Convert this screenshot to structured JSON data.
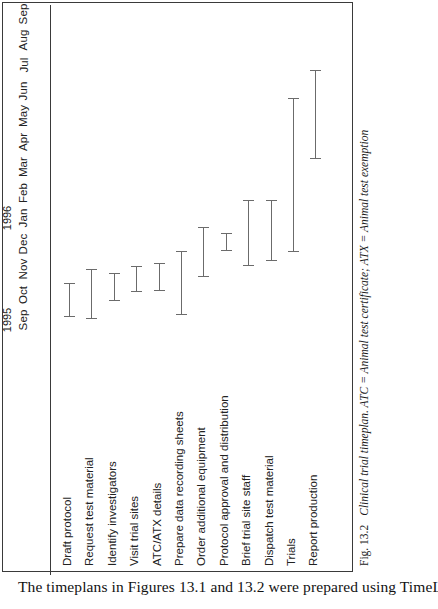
{
  "page": {
    "body_text": "The timeplans in Figures 13.1 and 13.2 were prepared using TimeLine"
  },
  "figure": {
    "number": "Fig. 13.2",
    "caption": "Clinical trial timeplan. ATC = Animal test certificate; ATX = Animal test exemption",
    "frame_color": "#3a3a3a",
    "bar_color": "#6b6b6b"
  },
  "chart_data": {
    "type": "bar",
    "title": "Clinical trial timeplan",
    "orientation": "gantt-rotated",
    "xlabel": "",
    "ylabel": "",
    "grid": false,
    "legend": "none",
    "years": [
      {
        "label": "1995",
        "months": [
          "Sep",
          "Oct",
          "Nov",
          "Dec"
        ]
      },
      {
        "label": "1996",
        "months": [
          "Jan",
          "Feb",
          "Mar",
          "Apr",
          "May",
          "Jun",
          "Jul",
          "Aug",
          "Sep"
        ]
      }
    ],
    "axis_ticks": [
      "Sep",
      "Oct",
      "Nov",
      "Dec",
      "Jan",
      "Feb",
      "Mar",
      "Apr",
      "May",
      "Jun",
      "Jul",
      "Aug",
      "Sep"
    ],
    "axis_range": [
      "1995-09",
      "1996-09"
    ],
    "categories": [
      "Draft protocol",
      "Request test material",
      "Identify investigators",
      "Visit trial sites",
      "ATC/ATX details",
      "Prepare data recording sheets",
      "Order additional equipment",
      "Protocol approval and distribution",
      "Brief trial site staff",
      "Dispatch test material",
      "Trials",
      "Report production"
    ],
    "tasks": [
      {
        "name": "Draft protocol",
        "start": "Sep 1995",
        "end": "Oct 1995",
        "start_index": 0.1,
        "end_index": 1.45
      },
      {
        "name": "Request test material",
        "start": "Sep 1995",
        "end": "Nov 1995",
        "start_index": 0.05,
        "end_index": 2.0
      },
      {
        "name": "Identify investigators",
        "start": "Oct 1995",
        "end": "Nov 1995",
        "start_index": 0.75,
        "end_index": 1.85
      },
      {
        "name": "Visit trial sites",
        "start": "Oct 1995",
        "end": "Nov 1995",
        "start_index": 1.1,
        "end_index": 2.1
      },
      {
        "name": "ATC/ATX details",
        "start": "Oct 1995",
        "end": "Dec 1995",
        "start_index": 1.15,
        "end_index": 2.25
      },
      {
        "name": "Prepare data recording sheets",
        "start": "Sep 1995",
        "end": "Dec 1995",
        "start_index": 0.2,
        "end_index": 2.7
      },
      {
        "name": "Order additional equipment",
        "start": "Nov 1995",
        "end": "Jan 1996",
        "start_index": 1.7,
        "end_index": 3.65
      },
      {
        "name": "Protocol approval and distribution",
        "start": "Dec 1995",
        "end": "Jan 1996",
        "start_index": 2.7,
        "end_index": 3.4
      },
      {
        "name": "Brief trial site staff",
        "start": "Dec 1995",
        "end": "Mar 1996",
        "start_index": 2.1,
        "end_index": 4.7
      },
      {
        "name": "Dispatch test material",
        "start": "Jan 1996",
        "end": "Mar 1996",
        "start_index": 2.3,
        "end_index": 4.7
      },
      {
        "name": "Trials",
        "start": "Jan 1996",
        "end": "Jul 1996",
        "start_index": 2.65,
        "end_index": 8.7
      },
      {
        "name": "Report production",
        "start": "Jun 1996",
        "end": "Sep 1996",
        "start_index": 6.3,
        "end_index": 9.8
      }
    ],
    "values": [
      1.35,
      1.95,
      1.1,
      1.0,
      1.1,
      2.5,
      1.95,
      0.7,
      2.6,
      2.4,
      6.05,
      3.5
    ]
  }
}
